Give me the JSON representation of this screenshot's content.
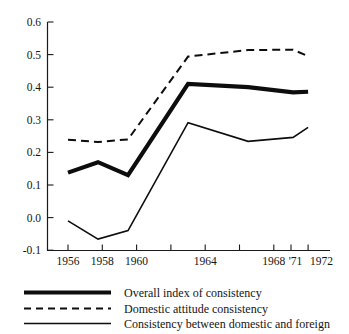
{
  "chart_data": {
    "type": "line",
    "title": "",
    "xlabel": "",
    "ylabel": "",
    "xlim": [
      1955,
      1973
    ],
    "ylim": [
      -0.1,
      0.6
    ],
    "grid": false,
    "legend_position": "bottom-left",
    "y_ticks": [
      "0.6",
      "0.5",
      "0.4",
      "0.3",
      "0.2",
      "0.1",
      "0.0",
      "-0.1"
    ],
    "y_tick_values": [
      0.6,
      0.5,
      0.4,
      0.3,
      0.2,
      0.1,
      0.0,
      -0.1
    ],
    "x_ticks": [
      "1956",
      "1958",
      "1960",
      "1964",
      "1968",
      "'71",
      "1972"
    ],
    "x_tick_values": [
      1956,
      1958,
      1960,
      1962,
      1964,
      1966,
      1968,
      1971,
      1972
    ],
    "x_tick_labels_shown": [
      {
        "value": 1956,
        "label": "1956"
      },
      {
        "value": 1958,
        "label": "1958"
      },
      {
        "value": 1960,
        "label": "1960"
      },
      {
        "value": 1964,
        "label": "1964"
      },
      {
        "value": 1968,
        "label": "1968"
      },
      {
        "value": 1971,
        "label": "'71"
      },
      {
        "value": 1972,
        "label": "1972"
      }
    ],
    "x": [
      1956,
      1958,
      1960,
      1964,
      1968,
      1971,
      1972
    ],
    "series": [
      {
        "name": "Overall index of consistency",
        "style": "thick-solid",
        "values": [
          0.138,
          0.17,
          0.13,
          0.41,
          0.4,
          0.384,
          0.386
        ]
      },
      {
        "name": "Domestic attitude consistency",
        "style": "dashed",
        "values": [
          0.239,
          0.232,
          0.24,
          0.494,
          0.514,
          0.515,
          0.495
        ]
      },
      {
        "name": "Consistency between domestic and foreign",
        "style": "thin-solid",
        "values": [
          -0.01,
          -0.066,
          -0.04,
          0.291,
          0.234,
          0.246,
          0.277
        ]
      }
    ]
  },
  "legend": {
    "items": [
      {
        "label": "Overall index of consistency",
        "style": "thick-solid"
      },
      {
        "label": "Domestic attitude consistency",
        "style": "dashed"
      },
      {
        "label": "Consistency between domestic and foreign",
        "style": "thin-solid"
      }
    ]
  }
}
